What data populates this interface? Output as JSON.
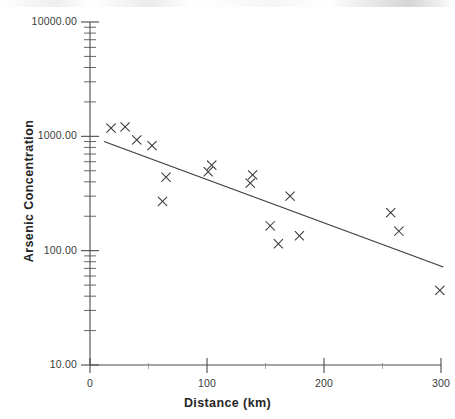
{
  "figure": {
    "kind": "scatter-plot-with-fit-line",
    "background_color": "#ffffff",
    "ink_color": "#3a3a3a"
  },
  "axes": {
    "x": {
      "title": "Distance (km)",
      "tick_labels": [
        "0",
        "100",
        "200",
        "300"
      ],
      "tick_values": [
        0,
        100,
        200,
        300
      ],
      "range": [
        0,
        300
      ],
      "scale": "linear"
    },
    "y": {
      "title": "Arsenic Concentration",
      "tick_labels": [
        "10000.00",
        "1000.00",
        "100.00",
        "10.00"
      ],
      "tick_values": [
        10000,
        1000,
        100,
        10
      ],
      "range": [
        10,
        10000
      ],
      "scale": "log"
    }
  },
  "chart_data": {
    "type": "scatter",
    "title": "",
    "subtitle": "",
    "xlabel": "Distance (km)",
    "ylabel": "Arsenic Concentration",
    "xlim": [
      0,
      300
    ],
    "ylim": [
      10,
      10000
    ],
    "yscale": "log",
    "xscale": "linear",
    "grid": false,
    "legend": null,
    "marker": "x",
    "marker_color": "#3a3a3a",
    "series": [
      {
        "name": "Arsenic samples",
        "marker": "x",
        "points": [
          {
            "x": 18,
            "y": 1180
          },
          {
            "x": 30,
            "y": 1210
          },
          {
            "x": 40,
            "y": 930
          },
          {
            "x": 53,
            "y": 830
          },
          {
            "x": 65,
            "y": 440
          },
          {
            "x": 62,
            "y": 270
          },
          {
            "x": 101,
            "y": 490
          },
          {
            "x": 104,
            "y": 560
          },
          {
            "x": 139,
            "y": 460
          },
          {
            "x": 137,
            "y": 390
          },
          {
            "x": 154,
            "y": 165
          },
          {
            "x": 161,
            "y": 115
          },
          {
            "x": 171,
            "y": 300
          },
          {
            "x": 179,
            "y": 135
          },
          {
            "x": 257,
            "y": 215
          },
          {
            "x": 264,
            "y": 148
          },
          {
            "x": 299,
            "y": 45
          }
        ]
      }
    ],
    "fit_line": {
      "name": "regression line",
      "style": "solid",
      "color": "#3a3a3a",
      "x_start": 12,
      "y_start": 900,
      "x_end": 302,
      "y_end": 72
    }
  }
}
